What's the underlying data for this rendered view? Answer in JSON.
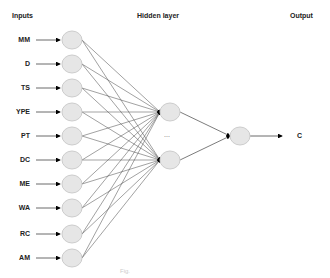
{
  "headers": {
    "inputs": "Inputs",
    "hidden": "Hidden layer",
    "output": "Output"
  },
  "inputs": [
    "MM",
    "D",
    "TS",
    "YPE",
    "PT",
    "DC",
    "ME",
    "WA",
    "RC",
    "AM"
  ],
  "hidden_ellipsis": "...",
  "output_label": "C",
  "caption": "Fig.",
  "colors": {
    "node_fill": "#e6e6e6",
    "node_stroke": "#cccccc",
    "line": "#444444",
    "arrowhead": "#000000"
  }
}
